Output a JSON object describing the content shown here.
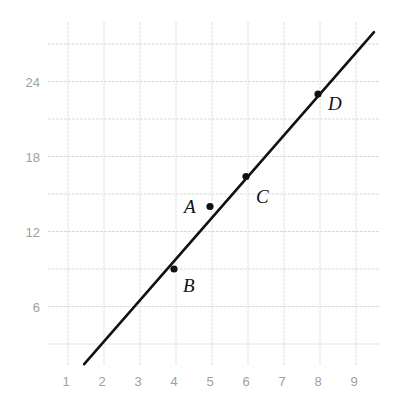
{
  "chart_data": {
    "type": "scatter",
    "title": "",
    "xlabel": "",
    "ylabel": "",
    "xlim": [
      0.45,
      9.7
    ],
    "ylim": [
      1.3,
      28.8
    ],
    "grid": true,
    "x_ticks": [
      1,
      2,
      3,
      4,
      5,
      6,
      7,
      8,
      9
    ],
    "y_ticks": [
      6,
      12,
      18,
      24
    ],
    "x_gridlines": [
      1,
      2,
      3,
      4,
      5,
      6,
      7,
      8,
      9
    ],
    "y_gridlines": [
      3,
      6,
      9,
      12,
      15,
      18,
      21,
      24,
      27
    ],
    "points": [
      {
        "label": "A",
        "x": 5,
        "y": 14
      },
      {
        "label": "B",
        "x": 4,
        "y": 9
      },
      {
        "label": "C",
        "x": 6,
        "y": 16.4
      },
      {
        "label": "D",
        "x": 8,
        "y": 23
      }
    ],
    "line": {
      "description": "line of best fit through C and D",
      "slope": 3.3,
      "intercept": -3.4,
      "x_start": 1.45,
      "x_end": 9.5
    },
    "colors": {
      "line": "#111111",
      "points": "#111111",
      "grid": "#dcdcdc",
      "tick_labels": "#a0a0a0"
    }
  }
}
